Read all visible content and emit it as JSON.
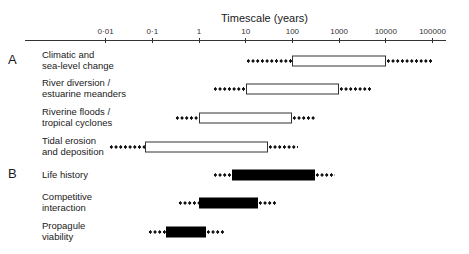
{
  "chart_data": {
    "type": "range",
    "title": "Timescale (years)",
    "xlabel": "Timescale (years)",
    "ylabel": "",
    "xscale": "log",
    "xlim": [
      0.001,
      200000
    ],
    "x_ticks": [
      0.01,
      0.1,
      1,
      10,
      100,
      1000,
      10000,
      100000
    ],
    "x_tick_labels": [
      "0·01",
      "0·1",
      "1",
      "10",
      "100",
      "1000",
      "10000",
      "100000"
    ],
    "grid": false,
    "legend": null,
    "groups": [
      {
        "letter": "A",
        "style": "open-box",
        "rows": [
          {
            "label": "Climatic and sea-level change",
            "label_lines": [
              "Climatic and",
              "sea-level change"
            ],
            "dots_min": 10,
            "box_min": 100,
            "box_max": 10000,
            "dots_max": 100000
          },
          {
            "label": "River diversion / estuarine meanders",
            "label_lines": [
              "River diversion /",
              "estuarine meanders"
            ],
            "dots_min": 2,
            "box_min": 10,
            "box_max": 1000,
            "dots_max": 5000
          },
          {
            "label": "Riverine floods / tropical cyclones",
            "label_lines": [
              "Riverine floods /",
              "tropical cyclones"
            ],
            "dots_min": 0.3,
            "box_min": 1,
            "box_max": 100,
            "dots_max": 300
          },
          {
            "label": "Tidal erosion and deposition",
            "label_lines": [
              "Tidal erosion",
              "and deposition"
            ],
            "dots_min": 0.012,
            "box_min": 0.07,
            "box_max": 30,
            "dots_max": 130
          }
        ]
      },
      {
        "letter": "B",
        "style": "filled-box",
        "rows": [
          {
            "label": "Life history",
            "label_lines": [
              "Life history"
            ],
            "dots_min": 2,
            "box_min": 5,
            "box_max": 300,
            "dots_max": 800
          },
          {
            "label": "Competitive interaction",
            "label_lines": [
              "Competitive",
              "interaction"
            ],
            "dots_min": 0.35,
            "box_min": 1,
            "box_max": 18,
            "dots_max": 45
          },
          {
            "label": "Propagule viability",
            "label_lines": [
              "Propagule",
              "viability"
            ],
            "dots_min": 0.08,
            "box_min": 0.2,
            "box_max": 1.4,
            "dots_max": 3.5
          }
        ]
      }
    ]
  }
}
